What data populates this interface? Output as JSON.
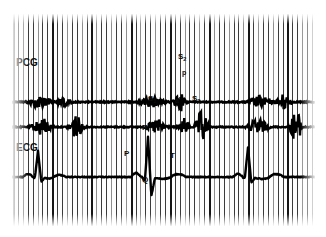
{
  "figure": {
    "type": "physiological-recording-strip",
    "background_color": "#ffffff",
    "paper_color": "#fdfdfd",
    "trace_color": "#000000",
    "grid_color": "#3a3a3a"
  },
  "leads": [
    {
      "id": "pcg",
      "label": "PCG",
      "label_x": 16,
      "label_y": 58
    },
    {
      "id": "ecg",
      "label": "ECG",
      "label_x": 16,
      "label_y": 143
    }
  ],
  "annotations": [
    {
      "id": "s2",
      "text": "S",
      "sub": "2",
      "x": 178,
      "y": 53,
      "size": "ann-label"
    },
    {
      "id": "p-sound",
      "text": "p",
      "sub": "",
      "x": 182,
      "y": 69,
      "size": "ann-label-sm"
    },
    {
      "id": "s1",
      "text": "S",
      "sub": "1",
      "x": 148,
      "y": 95,
      "size": "ann-label"
    },
    {
      "id": "a-wave",
      "text": "a",
      "sub": "",
      "x": 175,
      "y": 97,
      "size": "ann-label-sm"
    },
    {
      "id": "s3",
      "text": "S",
      "sub": "3",
      "x": 192,
      "y": 95,
      "size": "ann-label"
    },
    {
      "id": "r-wave",
      "text": "R",
      "sub": "",
      "x": 142,
      "y": 124,
      "size": "ann-label"
    },
    {
      "id": "p-wave",
      "text": "P",
      "sub": "",
      "x": 124,
      "y": 150,
      "size": "ann-label"
    },
    {
      "id": "t-wave",
      "text": "T",
      "sub": "",
      "x": 170,
      "y": 152,
      "size": "ann-label"
    },
    {
      "id": "q-wave",
      "text": "Q",
      "sub": "",
      "x": 142,
      "y": 176,
      "size": "ann-label"
    }
  ],
  "chart_data": {
    "type": "line",
    "title": "",
    "xlabel": "",
    "ylabel": "",
    "grid": true,
    "legend": "none",
    "x_range": [
      0,
      303
    ],
    "timing_grid": {
      "count": 62,
      "spacing_px": 4.9,
      "major_every": 8,
      "note": "vertical time-marker lines spanning full paper height"
    },
    "series": [
      {
        "name": "PCG channel 1",
        "baseline_y": 88,
        "amplitude_scale": 1.0,
        "bursts": [
          {
            "center": 28,
            "width": 16,
            "height": 7,
            "label": "S1"
          },
          {
            "center": 52,
            "width": 10,
            "height": 5,
            "label": "S2"
          },
          {
            "center": 140,
            "width": 18,
            "height": 6,
            "label": "S1"
          },
          {
            "center": 168,
            "width": 9,
            "height": 11,
            "label": "S2"
          },
          {
            "center": 248,
            "width": 16,
            "height": 7,
            "label": "S1"
          },
          {
            "center": 272,
            "width": 10,
            "height": 9,
            "label": "S2"
          }
        ]
      },
      {
        "name": "PCG channel 2",
        "baseline_y": 113,
        "amplitude_scale": 1.3,
        "bursts": [
          {
            "center": 30,
            "width": 14,
            "height": 8,
            "label": "S1"
          },
          {
            "center": 64,
            "width": 10,
            "height": 11,
            "label": "S2"
          },
          {
            "center": 145,
            "width": 14,
            "height": 7,
            "label": "S1"
          },
          {
            "center": 172,
            "width": 8,
            "height": 7,
            "label": "a"
          },
          {
            "center": 190,
            "width": 9,
            "height": 16,
            "label": "S3"
          },
          {
            "center": 246,
            "width": 14,
            "height": 8,
            "label": "S1"
          },
          {
            "center": 284,
            "width": 8,
            "height": 17,
            "label": "S3"
          }
        ]
      },
      {
        "name": "ECG",
        "baseline_y": 163,
        "beats": [
          {
            "r_x": 26,
            "r_height": 26,
            "q_depth": 4,
            "p_x": 16,
            "p_height": 3,
            "t_x": 46,
            "t_height": 3
          },
          {
            "r_x": 136,
            "r_height": 40,
            "q_depth": 18,
            "p_x": 124,
            "p_height": 4,
            "t_x": 166,
            "t_height": 3
          },
          {
            "r_x": 236,
            "r_height": 30,
            "q_depth": 5,
            "p_x": 226,
            "p_height": 3,
            "t_x": 264,
            "t_height": 3
          }
        ]
      }
    ]
  }
}
